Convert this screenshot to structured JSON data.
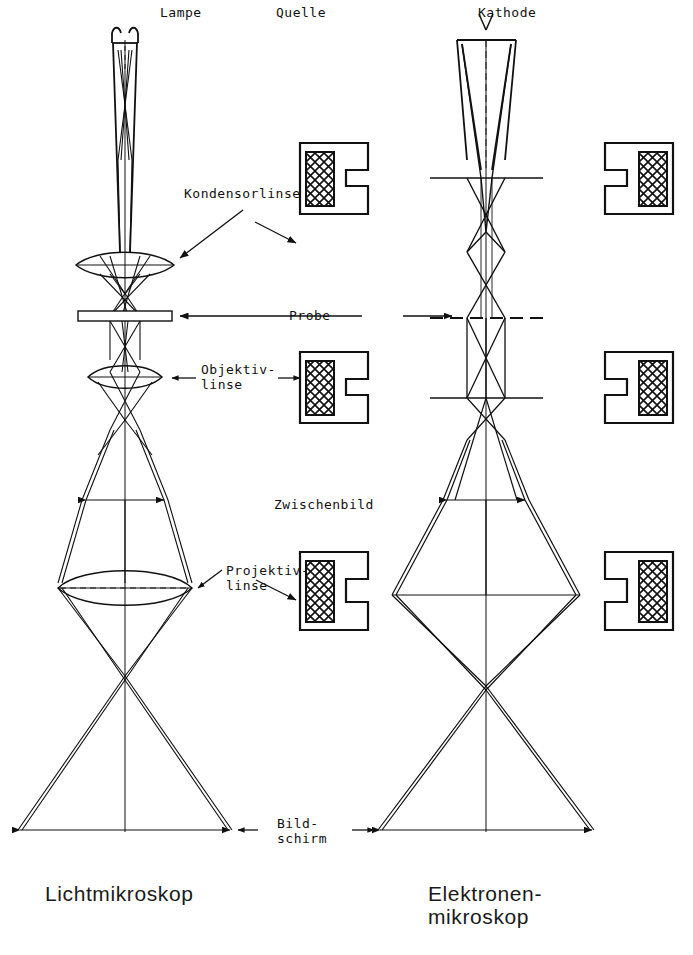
{
  "figure": {
    "title_left": "Lichtmikroskop",
    "title_right": "Elektronen-\nmikroskop",
    "source_label_left": "Lampe",
    "source_label_center": "Quelle",
    "source_label_right": "Kathode",
    "labels": {
      "condenser": "Kondensorlinse",
      "specimen": "Probe",
      "objective": "Objektiv-\nlinse",
      "intermediate_image": "Zwischenbild",
      "projective": "Projektiv-\nlinse",
      "screen": "Bild-\nschirm"
    },
    "colors": {
      "ink": "#111111",
      "paper": "#ffffff"
    },
    "elements": {
      "light_column": {
        "source": "incandescent-lamp",
        "condenser": "biconvex-glass-lens",
        "specimen": "glass-slide",
        "objective": "biconvex-glass-lens",
        "projective": "biconvex-glass-lens",
        "screen": "projection-screen"
      },
      "electron_column": {
        "source": "hairpin-cathode",
        "condenser": "magnetic-pole-piece-lens",
        "specimen": "specimen-plane",
        "objective": "magnetic-pole-piece-lens",
        "projective": "magnetic-pole-piece-lens",
        "screen": "fluorescent-screen"
      }
    }
  }
}
